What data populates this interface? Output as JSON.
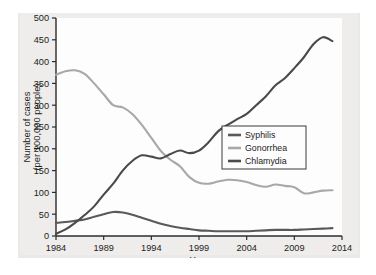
{
  "chart_data": {
    "type": "line",
    "title": "",
    "xlabel": "Year",
    "ylabel": "Number of cases (per 100,000 people)",
    "ylabel_line1": "Number of cases",
    "ylabel_line2": "(per 100,000 people)",
    "xlim": [
      1984,
      2014
    ],
    "ylim": [
      0,
      500
    ],
    "xticks": [
      1984,
      1989,
      1994,
      1999,
      2004,
      2009,
      2014
    ],
    "xticklabels": [
      "1984",
      "1989",
      "1994",
      "1999",
      "2004",
      "2009",
      "2014"
    ],
    "yticks": [
      0,
      50,
      100,
      150,
      200,
      250,
      300,
      350,
      400,
      450,
      500
    ],
    "yticklabels": [
      "0",
      "50",
      "100",
      "150",
      "200",
      "250",
      "300",
      "350",
      "400",
      "450",
      "500"
    ],
    "grid": false,
    "legend_position": "center-right-inside",
    "x": [
      1984,
      1985,
      1986,
      1987,
      1988,
      1989,
      1990,
      1991,
      1992,
      1993,
      1994,
      1995,
      1996,
      1997,
      1998,
      1999,
      2000,
      2001,
      2002,
      2003,
      2004,
      2005,
      2006,
      2007,
      2008,
      2009,
      2010,
      2011,
      2012,
      2013
    ],
    "series": [
      {
        "name": "Syphilis",
        "color": "#595959",
        "values": [
          30,
          32,
          35,
          38,
          44,
          50,
          55,
          54,
          49,
          42,
          35,
          28,
          23,
          19,
          16,
          13,
          12,
          11,
          11,
          11,
          11,
          12,
          13,
          14,
          14,
          14,
          15,
          16,
          17,
          18
        ]
      },
      {
        "name": "Gonorrhea",
        "color": "#a8a8a8",
        "values": [
          370,
          378,
          380,
          372,
          350,
          325,
          300,
          295,
          280,
          255,
          225,
          195,
          175,
          160,
          135,
          122,
          120,
          125,
          129,
          128,
          124,
          117,
          113,
          118,
          115,
          112,
          98,
          100,
          104,
          105
        ]
      },
      {
        "name": "Chlamydia",
        "color": "#4a4a4a",
        "values": [
          5,
          15,
          30,
          48,
          68,
          95,
          120,
          150,
          172,
          185,
          182,
          178,
          188,
          196,
          190,
          196,
          215,
          240,
          255,
          268,
          280,
          300,
          320,
          345,
          362,
          385,
          410,
          440,
          456,
          447
        ]
      }
    ]
  },
  "legend": {
    "items": [
      {
        "label": "Syphilis"
      },
      {
        "label": "Gonorrhea"
      },
      {
        "label": "Chlamydia"
      }
    ]
  }
}
